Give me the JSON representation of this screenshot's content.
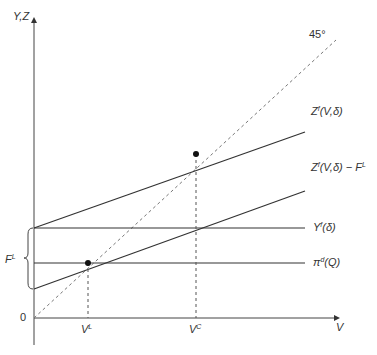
{
  "diagram": {
    "axes": {
      "y_label": "Y,Z",
      "x_label": "V",
      "origin_label": "0"
    },
    "lines": [
      {
        "name": "Z^f(V,δ)",
        "label_main": "Z",
        "label_sup": "f",
        "label_rest": "(V,δ)",
        "type": "solid"
      },
      {
        "name": "Z^f(V,δ) − F^L",
        "label_main": "Z",
        "label_sup": "f",
        "label_rest": "(V,δ) − F",
        "label_sup2": "L",
        "type": "solid"
      },
      {
        "name": "Y^f(δ)",
        "label_main": "Y",
        "label_sup": "f",
        "label_rest": "(δ)",
        "type": "solid"
      },
      {
        "name": "π^d(Q)",
        "label_main": "π",
        "label_sup": "d",
        "label_rest": "(Q)",
        "type": "solid"
      },
      {
        "name": "45°",
        "label": "45°",
        "type": "dashed"
      }
    ],
    "points": [
      {
        "name": "V^L",
        "label_main": "V",
        "label_sup": "L"
      },
      {
        "name": "V^C",
        "label_main": "V",
        "label_sup": "C"
      }
    ],
    "brace": {
      "label_main": "F",
      "label_sup": "L"
    },
    "colors": {
      "line": "#333333",
      "dashed": "#777777"
    }
  }
}
